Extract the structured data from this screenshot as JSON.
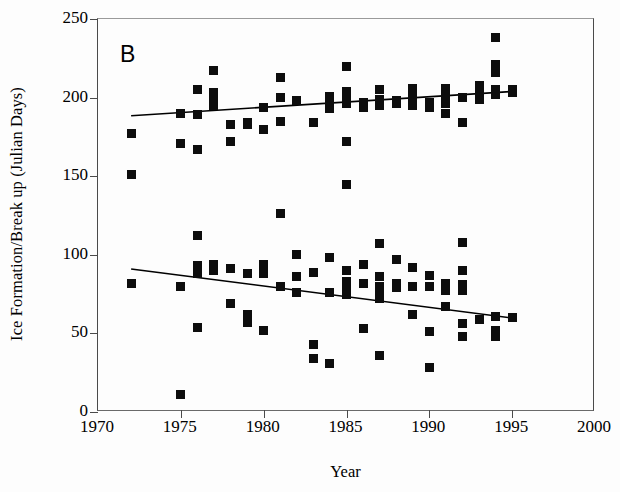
{
  "chart_data": {
    "type": "scatter",
    "title": "",
    "panel_label": "B",
    "xlabel": "Year",
    "ylabel": "Ice Formation/Break up (Julian Days)",
    "xlim": [
      1970,
      2000
    ],
    "ylim": [
      0,
      250
    ],
    "xticks": [
      1970,
      1975,
      1980,
      1985,
      1990,
      1995,
      2000
    ],
    "xtick_labels": [
      "1970",
      "1975",
      "1980",
      "1985",
      "1990",
      "1995",
      "2000"
    ],
    "yticks": [
      0,
      50,
      100,
      150,
      200,
      250
    ],
    "ytick_labels": [
      "0",
      "50",
      "100",
      "150",
      "200",
      "250"
    ],
    "grid": false,
    "legend": "none",
    "marker_color": "#0d0d0d",
    "marker_shape": "square",
    "line_color": "#000000",
    "series": [
      {
        "name": "Break up (Julian day)",
        "points": [
          [
            1972,
            177
          ],
          [
            1972,
            151
          ],
          [
            1975,
            190
          ],
          [
            1975,
            171
          ],
          [
            1976,
            205
          ],
          [
            1976,
            189
          ],
          [
            1976,
            167
          ],
          [
            1977,
            217
          ],
          [
            1977,
            203
          ],
          [
            1977,
            199
          ],
          [
            1977,
            195
          ],
          [
            1978,
            183
          ],
          [
            1978,
            172
          ],
          [
            1979,
            184
          ],
          [
            1979,
            183
          ],
          [
            1980,
            194
          ],
          [
            1980,
            180
          ],
          [
            1981,
            213
          ],
          [
            1981,
            200
          ],
          [
            1981,
            185
          ],
          [
            1982,
            198
          ],
          [
            1983,
            184
          ],
          [
            1984,
            201
          ],
          [
            1984,
            197
          ],
          [
            1984,
            193
          ],
          [
            1985,
            220
          ],
          [
            1985,
            204
          ],
          [
            1985,
            200
          ],
          [
            1985,
            196
          ],
          [
            1985,
            172
          ],
          [
            1986,
            197
          ],
          [
            1986,
            194
          ],
          [
            1987,
            205
          ],
          [
            1987,
            199
          ],
          [
            1987,
            195
          ],
          [
            1988,
            198
          ],
          [
            1988,
            196
          ],
          [
            1989,
            206
          ],
          [
            1989,
            203
          ],
          [
            1989,
            198
          ],
          [
            1989,
            195
          ],
          [
            1990,
            197
          ],
          [
            1990,
            194
          ],
          [
            1991,
            206
          ],
          [
            1991,
            203
          ],
          [
            1991,
            199
          ],
          [
            1991,
            196
          ],
          [
            1991,
            190
          ],
          [
            1992,
            200
          ],
          [
            1992,
            184
          ],
          [
            1993,
            208
          ],
          [
            1993,
            202
          ],
          [
            1993,
            199
          ],
          [
            1994,
            238
          ],
          [
            1994,
            221
          ],
          [
            1994,
            216
          ],
          [
            1994,
            205
          ],
          [
            1994,
            202
          ],
          [
            1995,
            205
          ],
          [
            1995,
            203
          ]
        ]
      },
      {
        "name": "Ice formation (Julian day)",
        "points": [
          [
            1972,
            82
          ],
          [
            1975,
            80
          ],
          [
            1975,
            11
          ],
          [
            1976,
            112
          ],
          [
            1976,
            93
          ],
          [
            1976,
            88
          ],
          [
            1976,
            54
          ],
          [
            1977,
            94
          ],
          [
            1977,
            90
          ],
          [
            1978,
            91
          ],
          [
            1978,
            69
          ],
          [
            1979,
            88
          ],
          [
            1979,
            62
          ],
          [
            1979,
            57
          ],
          [
            1980,
            94
          ],
          [
            1980,
            88
          ],
          [
            1980,
            52
          ],
          [
            1981,
            126
          ],
          [
            1981,
            80
          ],
          [
            1982,
            100
          ],
          [
            1982,
            86
          ],
          [
            1982,
            76
          ],
          [
            1983,
            89
          ],
          [
            1983,
            43
          ],
          [
            1983,
            34
          ],
          [
            1984,
            98
          ],
          [
            1984,
            76
          ],
          [
            1984,
            31
          ],
          [
            1985,
            145
          ],
          [
            1985,
            90
          ],
          [
            1985,
            83
          ],
          [
            1985,
            80
          ],
          [
            1985,
            75
          ],
          [
            1986,
            94
          ],
          [
            1986,
            82
          ],
          [
            1986,
            53
          ],
          [
            1987,
            107
          ],
          [
            1987,
            86
          ],
          [
            1987,
            80
          ],
          [
            1987,
            74
          ],
          [
            1987,
            72
          ],
          [
            1987,
            36
          ],
          [
            1988,
            97
          ],
          [
            1988,
            82
          ],
          [
            1988,
            79
          ],
          [
            1989,
            92
          ],
          [
            1989,
            80
          ],
          [
            1989,
            62
          ],
          [
            1990,
            87
          ],
          [
            1990,
            80
          ],
          [
            1990,
            51
          ],
          [
            1990,
            28
          ],
          [
            1991,
            82
          ],
          [
            1991,
            77
          ],
          [
            1991,
            67
          ],
          [
            1992,
            108
          ],
          [
            1992,
            90
          ],
          [
            1992,
            81
          ],
          [
            1992,
            77
          ],
          [
            1992,
            56
          ],
          [
            1992,
            48
          ],
          [
            1993,
            59
          ],
          [
            1994,
            61
          ],
          [
            1994,
            52
          ],
          [
            1994,
            48
          ],
          [
            1995,
            60
          ]
        ]
      }
    ],
    "trend_lines": [
      {
        "name": "Break up trend",
        "x_start": 1972.0,
        "y_start": 188.5,
        "x_end": 1995.2,
        "y_end": 204.0
      },
      {
        "name": "Ice formation trend",
        "x_start": 1972.0,
        "y_start": 91.0,
        "x_end": 1995.2,
        "y_end": 59.5
      }
    ]
  }
}
